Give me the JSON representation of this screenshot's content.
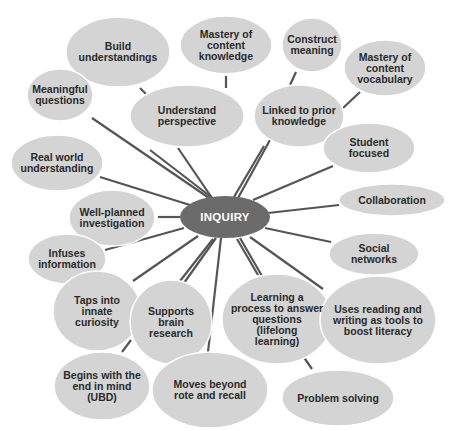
{
  "colors": {
    "background": "#ffffff",
    "node_fill": "#d4d4d4",
    "center_fill": "#6b6b6b",
    "line": "#555555",
    "text": "#2a2a2a",
    "center_text": "#ffffff"
  },
  "center": {
    "label": "INQUIRY",
    "cx": 225,
    "cy": 217,
    "rx": 45,
    "ry": 21
  },
  "nodes": [
    {
      "id": "build-understandings",
      "label": "Build\nunderstandings",
      "cx": 118,
      "cy": 52,
      "rx": 52,
      "ry": 35,
      "line": [
        140,
        88,
        146,
        94
      ]
    },
    {
      "id": "mastery-content-knowledge",
      "label": "Mastery of\ncontent\nknowledge",
      "cx": 226,
      "cy": 45,
      "rx": 46,
      "ry": 29,
      "line": [
        226,
        76,
        226,
        88
      ]
    },
    {
      "id": "construct-meaning",
      "label": "Construct\nmeaning",
      "cx": 312,
      "cy": 45,
      "rx": 30,
      "ry": 27,
      "line": [
        296,
        72,
        290,
        85
      ]
    },
    {
      "id": "mastery-content-vocabulary",
      "label": "Mastery of\ncontent\nvocabulary",
      "cx": 385,
      "cy": 68,
      "rx": 41,
      "ry": 28,
      "line": [
        360,
        92,
        343,
        108
      ]
    },
    {
      "id": "meaningful-questions",
      "label": "Meaningful\nquestions",
      "cx": 60,
      "cy": 95,
      "rx": 33,
      "ry": 26,
      "line": [
        92,
        118,
        212,
        200
      ]
    },
    {
      "id": "understand-perspective",
      "label": "Understand\nperspective",
      "cx": 187,
      "cy": 116,
      "rx": 57,
      "ry": 31,
      "line": [
        178,
        148,
        212,
        198
      ]
    },
    {
      "id": "linked-prior-knowledge",
      "label": "Linked to prior\nknowledge",
      "cx": 299,
      "cy": 116,
      "rx": 45,
      "ry": 31,
      "line": [
        264,
        146,
        234,
        197
      ]
    },
    {
      "id": "real-world-understanding",
      "label": "Real world\nunderstanding",
      "cx": 57,
      "cy": 163,
      "rx": 46,
      "ry": 28,
      "line": [
        100,
        177,
        190,
        205
      ]
    },
    {
      "id": "student-focused",
      "label": "Student\nfocused",
      "cx": 369,
      "cy": 148,
      "rx": 46,
      "ry": 25,
      "line": [
        333,
        166,
        253,
        200
      ]
    },
    {
      "id": "well-planned-investigation",
      "label": "Well-planned\ninvestigation",
      "cx": 112,
      "cy": 218,
      "rx": 43,
      "ry": 28,
      "line": [
        158,
        217,
        180,
        217
      ]
    },
    {
      "id": "collaboration",
      "label": "Collaboration",
      "cx": 392,
      "cy": 200,
      "rx": 53,
      "ry": 16,
      "line": [
        339,
        205,
        268,
        213
      ]
    },
    {
      "id": "infuses-information",
      "label": "Infuses\ninformation",
      "cx": 67,
      "cy": 259,
      "rx": 39,
      "ry": 25,
      "line": [
        105,
        250,
        184,
        228
      ]
    },
    {
      "id": "social-networks",
      "label": "Social\nnetworks",
      "cx": 374,
      "cy": 254,
      "rx": 45,
      "ry": 21,
      "line": [
        331,
        242,
        265,
        228
      ]
    },
    {
      "id": "taps-innate-curiosity",
      "label": "Taps into\ninnate\ncuriosity",
      "cx": 97,
      "cy": 311,
      "rx": 44,
      "ry": 40,
      "line": [
        133,
        281,
        198,
        236
      ]
    },
    {
      "id": "supports-brain-research",
      "label": "Supports\nbrain\nresearch",
      "cx": 171,
      "cy": 322,
      "rx": 41,
      "ry": 42,
      "line": [
        180,
        281,
        213,
        239
      ]
    },
    {
      "id": "learning-process",
      "label": "Learning a\nprocess to answer\nquestions\n(lifelong\nlearning)",
      "cx": 277,
      "cy": 319,
      "rx": 55,
      "ry": 45,
      "line": [
        258,
        275,
        237,
        239
      ]
    },
    {
      "id": "uses-reading-writing",
      "label": "Uses reading and\nwriting as tools to\nboost literacy",
      "cx": 378,
      "cy": 320,
      "rx": 58,
      "ry": 44,
      "line": [
        323,
        289,
        250,
        237
      ]
    },
    {
      "id": "begins-with-end",
      "label": "Begins with the\nend in mind\n(UBD)",
      "cx": 102,
      "cy": 386,
      "rx": 48,
      "ry": 34,
      "line": [
        122,
        352,
        131,
        340
      ]
    },
    {
      "id": "moves-beyond-rote",
      "label": "Moves beyond\nrote and recall",
      "cx": 210,
      "cy": 390,
      "rx": 58,
      "ry": 38,
      "line": [
        208,
        352,
        221,
        238
      ]
    },
    {
      "id": "problem-solving",
      "label": "Problem solving",
      "cx": 338,
      "cy": 398,
      "rx": 56,
      "ry": 28,
      "line": [
        312,
        369,
        303,
        356
      ]
    }
  ],
  "extra_lines": [
    [
      150,
      150,
      215,
      200
    ],
    [
      270,
      140,
      238,
      198
    ],
    [
      184,
      283,
      216,
      238
    ],
    [
      262,
      276,
      240,
      238
    ]
  ]
}
